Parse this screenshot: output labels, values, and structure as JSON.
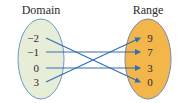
{
  "domain_label": "Domain",
  "range_label": "Range",
  "domain": [
    "−2",
    "−1",
    "0",
    "3"
  ],
  "range": [
    "9",
    "7",
    "3",
    "0"
  ],
  "mapping": [
    {
      "from": "−2",
      "to": "0"
    },
    {
      "from": "−1",
      "to": "7"
    },
    {
      "from": "0",
      "to": "3"
    },
    {
      "from": "3",
      "to": "9"
    }
  ],
  "colors": {
    "domain_fill": "#e8edd8",
    "domain_stroke": "#6a9bc4",
    "range_fill": "#f3b64a",
    "range_stroke": "#7a8aa8",
    "arrow": "#2f6fb5"
  }
}
